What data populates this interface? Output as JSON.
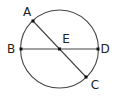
{
  "diagram": {
    "type": "circle-with-chords",
    "circle": {
      "center": "E",
      "cx": 59.5,
      "cy": 49,
      "r": 39
    },
    "stroke_color": "#444444",
    "point_color": "#111111",
    "points": {
      "A": {
        "label": "A",
        "x": 33,
        "y": 21,
        "lx": 27,
        "ly": 16
      },
      "B": {
        "label": "B",
        "x": 21,
        "y": 49,
        "lx": 11,
        "ly": 53
      },
      "C": {
        "label": "C",
        "x": 86,
        "y": 77,
        "lx": 95,
        "ly": 89
      },
      "D": {
        "label": "D",
        "x": 98,
        "y": 49,
        "lx": 105,
        "ly": 53
      },
      "E": {
        "label": "E",
        "x": 59.5,
        "y": 49,
        "lx": 66,
        "ly": 43
      }
    },
    "segments": [
      {
        "from": "A",
        "to": "C"
      },
      {
        "from": "B",
        "to": "D"
      }
    ]
  }
}
